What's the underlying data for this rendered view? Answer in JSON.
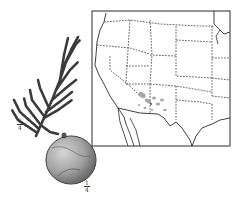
{
  "figure": {
    "foliage_scale": {
      "numerator": "1",
      "denominator": "4"
    },
    "cone_scale": {
      "numerator": "1",
      "denominator": "4"
    },
    "map": {
      "region": "western United States",
      "range_area": "southeastern Arizona / southwestern New Mexico"
    },
    "colors": {
      "ink": "#2a2a2a",
      "range_stipple": "#9a9a9a",
      "paper": "#ffffff"
    }
  }
}
